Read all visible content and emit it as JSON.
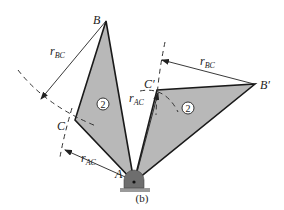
{
  "figure": {
    "caption": "(b)",
    "colors": {
      "body_fill": "#b8b8b8",
      "outline": "#1a1a1a",
      "dash": "#333333",
      "support": "#6e6e6e",
      "ground": "#9a9a9a"
    },
    "points": {
      "A": {
        "label": "A",
        "x": 134,
        "y": 182
      },
      "B": {
        "label": "B",
        "x": 106,
        "y": 21
      },
      "C": {
        "label": "C",
        "x": 75,
        "y": 120
      },
      "C_prime": {
        "label": "C′",
        "x": 157,
        "y": 90
      },
      "B_prime": {
        "label": "B′",
        "x": 255,
        "y": 84
      }
    },
    "bodies": [
      {
        "id": "original",
        "number": "2",
        "vertices": [
          "A",
          "B",
          "C"
        ]
      },
      {
        "id": "rotated",
        "number": "2",
        "vertices": [
          "A",
          "C_prime",
          "B_prime"
        ]
      }
    ],
    "dimensions": {
      "r_BC_left": {
        "main": "r",
        "sub": "BC"
      },
      "r_AC_left": {
        "main": "r",
        "sub": "AC"
      },
      "r_AC_right": {
        "main": "r",
        "sub": "AC"
      },
      "r_BC_right": {
        "main": "r",
        "sub": "BC"
      }
    }
  }
}
